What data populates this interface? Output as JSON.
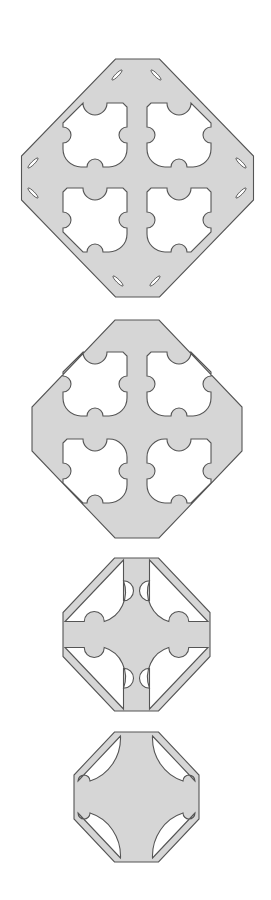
{
  "diagram": {
    "title": "",
    "colors": {
      "fill": "#d6d6d6",
      "stroke": "#555555",
      "background": "#ffffff"
    },
    "plates": [
      {
        "id": "plate-1",
        "cx": 137.5,
        "cy": 178,
        "half_width": 116,
        "half_height": 119,
        "flat_half": 22,
        "cutout_style": "quad-scalloped",
        "cutouts": [
          {
            "quadrant": "top-left",
            "x": 63,
            "y": 103,
            "size": 64
          },
          {
            "quadrant": "top-right",
            "x": 147,
            "y": 103,
            "size": 64
          },
          {
            "quadrant": "bottom-left",
            "x": 63,
            "y": 188,
            "size": 64
          },
          {
            "quadrant": "bottom-right",
            "x": 147,
            "y": 188,
            "size": 64
          }
        ],
        "slots": [
          {
            "x": 117,
            "y": 75,
            "angle": -45
          },
          {
            "x": 156,
            "y": 75,
            "angle": 45
          },
          {
            "x": 33,
            "y": 163,
            "angle": -45
          },
          {
            "x": 33,
            "y": 193,
            "angle": 45
          },
          {
            "x": 241,
            "y": 163,
            "angle": 45
          },
          {
            "x": 241,
            "y": 193,
            "angle": -45
          },
          {
            "x": 118,
            "y": 281,
            "angle": 45
          },
          {
            "x": 155,
            "y": 281,
            "angle": -45
          }
        ]
      },
      {
        "id": "plate-2",
        "cx": 137,
        "cy": 429,
        "half_width": 105,
        "half_height": 109,
        "flat_half": 22,
        "cutout_style": "quad-scalloped-rounded",
        "cutouts": [
          {
            "quadrant": "top-left",
            "x": 63,
            "y": 352,
            "size": 64
          },
          {
            "quadrant": "top-right",
            "x": 147,
            "y": 352,
            "size": 64
          },
          {
            "quadrant": "bottom-left",
            "x": 63,
            "y": 439,
            "size": 64
          },
          {
            "quadrant": "bottom-right",
            "x": 147,
            "y": 439,
            "size": 64
          }
        ],
        "slots": []
      },
      {
        "id": "plate-3",
        "cx": 136.5,
        "cy": 634.5,
        "half_width": 73.5,
        "half_height": 76.5,
        "flat_half": 22,
        "cutout_style": "triangular-cross",
        "arm_half": 13,
        "rim": 9,
        "bump_r": 10
      },
      {
        "id": "plate-4",
        "cx": 136.5,
        "cy": 797,
        "half_width": 62.5,
        "half_height": 65,
        "flat_half": 22,
        "cutout_style": "triangular-cross-concave",
        "arm_half": 16,
        "rim": 8,
        "bump_r": 6
      }
    ]
  }
}
